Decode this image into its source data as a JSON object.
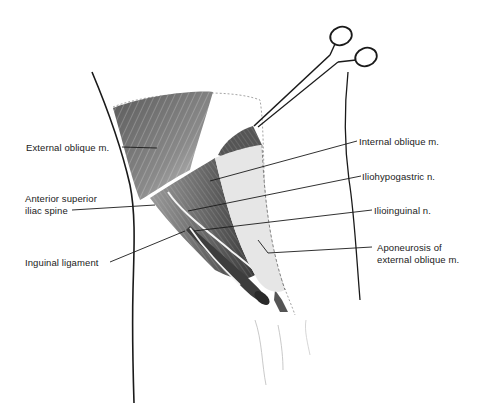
{
  "figure": {
    "labels": {
      "external_oblique": "External oblique m.",
      "asis_line1": "Anterior superior",
      "asis_line2": "iliac spine",
      "inguinal_ligament": "Inguinal ligament",
      "internal_oblique": "Internal oblique m.",
      "iliohypogastric": "Iliohypogastric n.",
      "ilioinguinal": "Ilioinguinal n.",
      "aponeurosis_line1": "Aponeurosis of",
      "aponeurosis_line2": "external oblique m."
    },
    "colors": {
      "ink": "#1a1a1a",
      "muscle_dark": "#4a4a4a",
      "muscle_mid": "#7a7a7a",
      "muscle_light": "#a8a8a8",
      "background": "#ffffff"
    }
  }
}
